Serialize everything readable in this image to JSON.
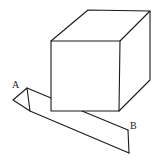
{
  "diagram": {
    "labels": {
      "a": "A",
      "b": "B"
    },
    "colors": {
      "stroke": "#1a1a1a",
      "background": "#ffffff"
    }
  }
}
